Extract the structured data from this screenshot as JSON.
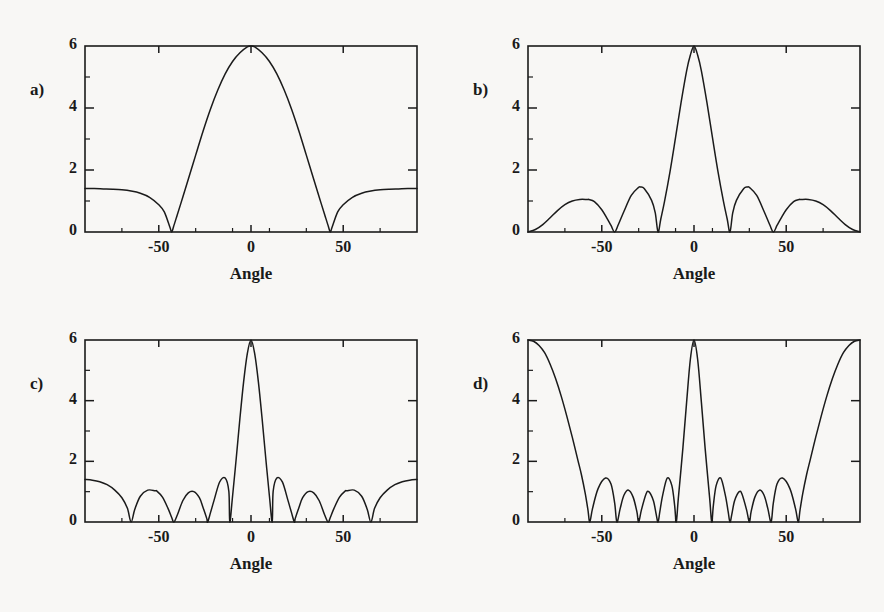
{
  "figure": {
    "background_color": "#f8f7f5",
    "ink_color": "#1b1b1b",
    "panel_count": 4
  },
  "axes": {
    "x_label": "Angle",
    "x_min": -90,
    "x_max": 90,
    "x_ticks": [
      -50,
      0,
      50
    ],
    "x_tick_labels": [
      "-50",
      "0",
      "50"
    ],
    "x_minor_ticks": [
      -90,
      -70,
      -30,
      -10,
      10,
      30,
      70,
      90
    ],
    "y_min": 0,
    "y_max": 6,
    "y_ticks": [
      0,
      2,
      4,
      6
    ],
    "y_tick_labels": [
      "0",
      "2",
      "4",
      "6"
    ],
    "y_minor_ticks": [
      1,
      3,
      5
    ],
    "grid": false,
    "legend": "none"
  },
  "panels": [
    {
      "id": "a",
      "label": "a)",
      "x_label": "Angle",
      "peak_value": 6,
      "nulls_deg": [
        -43,
        43
      ],
      "edge_value": 1.4,
      "sidelobe_peaks": [],
      "description": "Single broad main lobe peaking at 6 at 0 degrees, nulls near -43 and 43 degrees, rising to about 1.4 at the plot edges"
    },
    {
      "id": "b",
      "label": "b)",
      "x_label": "Angle",
      "peak_value": 6,
      "nulls_deg": [
        -90,
        -43,
        -19.5,
        19.5,
        43,
        90
      ],
      "edge_value": 0,
      "sidelobe_peaks": [
        {
          "angle": -57,
          "value": 1.05
        },
        {
          "angle": -29,
          "value": 1.45
        },
        {
          "angle": 29,
          "value": 1.45
        },
        {
          "angle": 57,
          "value": 1.05
        }
      ],
      "description": "Narrow main lobe peaking at 6 at 0 degrees with two sidelobes on each side, curve goes to zero at the edges"
    },
    {
      "id": "c",
      "label": "c)",
      "x_label": "Angle",
      "peak_value": 6,
      "nulls_deg": [
        -65,
        -41.8,
        -23.5,
        -11.5,
        11.5,
        23.5,
        41.8,
        65
      ],
      "edge_value": 1.4,
      "sidelobe_peaks": [
        {
          "angle": -90,
          "value": 1.4
        },
        {
          "angle": -51,
          "value": 1.05
        },
        {
          "angle": -31,
          "value": 1.0
        },
        {
          "angle": -17,
          "value": 1.45
        },
        {
          "angle": 17,
          "value": 1.45
        },
        {
          "angle": 31,
          "value": 1.0
        },
        {
          "angle": 51,
          "value": 1.05
        },
        {
          "angle": 90,
          "value": 1.4
        }
      ],
      "description": "Narrow main lobe peaking at 6 at 0 degrees with four sidelobes each side, curve rises to about 1.4 at the plot edges"
    },
    {
      "id": "d",
      "label": "d)",
      "x_label": "Angle",
      "peak_value": 6,
      "nulls_deg": [
        -56.5,
        -41.8,
        -30,
        -19.5,
        -9.6,
        9.6,
        19.5,
        30,
        41.8,
        56.5
      ],
      "edge_value": 6,
      "sidelobe_peaks": [
        {
          "angle": -48,
          "value": 1.45
        },
        {
          "angle": -35.5,
          "value": 1.05
        },
        {
          "angle": -24.5,
          "value": 1.0
        },
        {
          "angle": -14.5,
          "value": 1.45
        },
        {
          "angle": 14.5,
          "value": 1.45
        },
        {
          "angle": 24.5,
          "value": 1.0
        },
        {
          "angle": 35.5,
          "value": 1.05
        },
        {
          "angle": 48,
          "value": 1.45
        }
      ],
      "grating_lobes_deg": [
        -90,
        90
      ],
      "description": "Narrow main lobe peaking at 6 at 0 degrees with four sidelobes each side and full grating lobes reaching 6 at both plot edges"
    }
  ],
  "chart_data": {
    "type": "line",
    "title": "",
    "xlabel": "Angle",
    "ylabel": "",
    "xlim": [
      -90,
      90
    ],
    "ylim": [
      0,
      6
    ],
    "xticks": [
      -50,
      0,
      50
    ],
    "yticks": [
      0,
      2,
      4,
      6
    ],
    "grid": false,
    "legend": "none",
    "panel_count": 4,
    "element_count": 6,
    "panels": [
      {
        "id": "a",
        "label": "a)",
        "spacing_d_over_lambda": 0.25,
        "elements": 6,
        "series": [
          {
            "name": "array-factor-a",
            "x": [
              -90,
              -85,
              -80,
              -75,
              -70,
              -65,
              -60,
              -55,
              -50,
              -47,
              -44,
              -43,
              -42,
              -40,
              -37,
              -34,
              -30,
              -26,
              -22,
              -18,
              -14,
              -10,
              -6,
              -2,
              0,
              2,
              6,
              10,
              14,
              18,
              22,
              26,
              30,
              34,
              37,
              40,
              42,
              43,
              44,
              47,
              50,
              55,
              60,
              65,
              70,
              75,
              80,
              85,
              90
            ],
            "y": [
              1.4,
              1.4,
              1.39,
              1.38,
              1.36,
              1.32,
              1.25,
              1.12,
              0.88,
              0.65,
              0.16,
              0.0,
              0.17,
              0.55,
              1.12,
              1.7,
              2.48,
              3.25,
              3.96,
              4.58,
              5.1,
              5.5,
              5.78,
              5.97,
              6.0,
              5.97,
              5.78,
              5.5,
              5.1,
              4.58,
              3.96,
              3.25,
              2.48,
              1.7,
              1.12,
              0.55,
              0.17,
              0.0,
              0.16,
              0.65,
              0.88,
              1.12,
              1.25,
              1.32,
              1.36,
              1.38,
              1.39,
              1.4,
              1.4
            ]
          }
        ]
      },
      {
        "id": "b",
        "label": "b)",
        "spacing_d_over_lambda": 0.375,
        "elements": 6,
        "series": [
          {
            "name": "array-factor-b",
            "x": [
              -90,
              -86,
              -82,
              -78,
              -74,
              -70,
              -66,
              -62,
              -58,
              -57,
              -54,
              -50,
              -47,
              -45,
              -43,
              -41,
              -38,
              -34,
              -30,
              -29,
              -27,
              -23,
              -21,
              -19.5,
              -18,
              -16,
              -13,
              -10,
              -7,
              -4,
              -2,
              0,
              2,
              4,
              7,
              10,
              13,
              16,
              18,
              19.5,
              21,
              23,
              27,
              29,
              30,
              34,
              38,
              41,
              43,
              45,
              47,
              50,
              54,
              57,
              58,
              62,
              66,
              70,
              74,
              78,
              82,
              86,
              90
            ],
            "y": [
              0.0,
              0.08,
              0.24,
              0.46,
              0.69,
              0.88,
              1.0,
              1.05,
              1.05,
              1.05,
              0.98,
              0.72,
              0.42,
              0.21,
              0.0,
              0.24,
              0.66,
              1.18,
              1.44,
              1.45,
              1.4,
              1.02,
              0.62,
              0.0,
              0.42,
              0.98,
              1.95,
              3.05,
              4.18,
              5.2,
              5.7,
              6.0,
              5.7,
              5.2,
              4.18,
              3.05,
              1.95,
              0.98,
              0.42,
              0.0,
              0.62,
              1.02,
              1.4,
              1.45,
              1.44,
              1.18,
              0.66,
              0.24,
              0.0,
              0.21,
              0.42,
              0.72,
              0.98,
              1.05,
              1.05,
              1.05,
              1.0,
              0.88,
              0.69,
              0.46,
              0.24,
              0.08,
              0.0
            ]
          }
        ]
      },
      {
        "id": "c",
        "label": "c)",
        "spacing_d_over_lambda": 0.5,
        "elements": 6,
        "series": [
          {
            "name": "array-factor-c",
            "x": [
              -90,
              -86,
              -82,
              -78,
              -74,
              -70,
              -67,
              -65,
              -63,
              -60,
              -56,
              -52,
              -51,
              -48,
              -45,
              -43,
              -41.8,
              -40,
              -37,
              -34,
              -31,
              -28,
              -26,
              -24,
              -23.5,
              -22,
              -20,
              -17,
              -14,
              -12,
              -11.5,
              -10,
              -8,
              -6,
              -4,
              -2,
              0,
              2,
              4,
              6,
              8,
              10,
              11.5,
              12,
              14,
              17,
              20,
              22,
              23.5,
              24,
              26,
              28,
              31,
              34,
              37,
              40,
              41.8,
              43,
              45,
              48,
              51,
              52,
              56,
              60,
              63,
              65,
              67,
              70,
              74,
              78,
              82,
              86,
              90
            ],
            "y": [
              1.4,
              1.38,
              1.33,
              1.23,
              1.06,
              0.8,
              0.45,
              0.0,
              0.42,
              0.85,
              1.05,
              1.03,
              1.02,
              0.82,
              0.45,
              0.15,
              0.0,
              0.22,
              0.7,
              0.96,
              1.0,
              0.8,
              0.48,
              0.12,
              0.0,
              0.3,
              0.72,
              1.32,
              1.45,
              1.0,
              0.0,
              0.85,
              2.1,
              3.42,
              4.62,
              5.55,
              6.0,
              5.55,
              4.62,
              3.42,
              2.1,
              0.85,
              0.0,
              1.0,
              1.45,
              1.32,
              0.72,
              0.3,
              0.0,
              0.12,
              0.48,
              0.8,
              1.0,
              0.96,
              0.7,
              0.22,
              0.0,
              0.15,
              0.45,
              0.82,
              1.02,
              1.03,
              1.05,
              0.85,
              0.42,
              0.0,
              0.45,
              0.8,
              1.06,
              1.23,
              1.33,
              1.38,
              1.4
            ]
          }
        ]
      },
      {
        "id": "d",
        "label": "d)",
        "spacing_d_over_lambda": 1.0,
        "elements": 6,
        "series": [
          {
            "name": "array-factor-d",
            "x": [
              -90,
              -87,
              -84,
              -81,
              -78,
              -75,
              -72,
              -69,
              -66,
              -63,
              -61,
              -59,
              -57.5,
              -56.5,
              -55,
              -52,
              -48,
              -45,
              -43,
              -41.8,
              -40,
              -38,
              -35.5,
              -33,
              -31,
              -30,
              -28.5,
              -26,
              -24.5,
              -22,
              -20.5,
              -19.5,
              -18.5,
              -17,
              -14.5,
              -12,
              -10.5,
              -9.6,
              -8.5,
              -6,
              -4,
              -2,
              0,
              2,
              4,
              6,
              8.5,
              9.6,
              10.5,
              12,
              14.5,
              17,
              18.5,
              19.5,
              20.5,
              22,
              24.5,
              26,
              28.5,
              30,
              31,
              33,
              35.5,
              38,
              40,
              41.8,
              43,
              45,
              48,
              52,
              55,
              56.5,
              57.5,
              59,
              61,
              63,
              66,
              69,
              72,
              75,
              78,
              81,
              84,
              87,
              90
            ],
            "y": [
              6.0,
              5.96,
              5.82,
              5.58,
              5.2,
              4.72,
              4.15,
              3.5,
              2.8,
              2.05,
              1.55,
              0.95,
              0.4,
              0.0,
              0.45,
              1.1,
              1.45,
              1.25,
              0.62,
              0.0,
              0.45,
              0.88,
              1.05,
              0.82,
              0.35,
              0.0,
              0.4,
              0.92,
              1.0,
              0.7,
              0.25,
              0.0,
              0.35,
              0.88,
              1.45,
              1.2,
              0.55,
              0.0,
              0.78,
              2.45,
              3.95,
              5.35,
              6.0,
              5.35,
              3.95,
              2.45,
              0.78,
              0.0,
              0.55,
              1.2,
              1.45,
              0.88,
              0.35,
              0.0,
              0.25,
              0.7,
              1.0,
              0.92,
              0.4,
              0.0,
              0.35,
              0.82,
              1.05,
              0.88,
              0.45,
              0.0,
              0.62,
              1.25,
              1.45,
              1.1,
              0.45,
              0.0,
              0.4,
              0.95,
              1.55,
              2.05,
              2.8,
              3.5,
              4.15,
              4.72,
              5.2,
              5.58,
              5.82,
              5.96,
              6.0
            ]
          }
        ]
      }
    ]
  }
}
